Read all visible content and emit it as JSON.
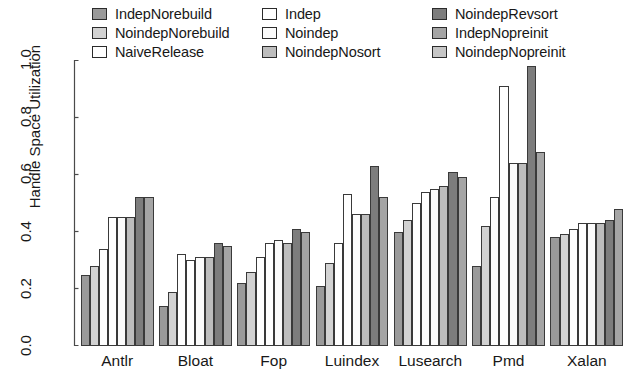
{
  "legend": {
    "entries": [
      {
        "label": "IndepNorebuild",
        "color": "#9a9a9a",
        "column": 0
      },
      {
        "label": "NoindepNorebuild",
        "color": "#d2d2d2",
        "column": 0
      },
      {
        "label": "NaiveRelease",
        "color": "#ffffff",
        "column": 0
      },
      {
        "label": "Indep",
        "color": "#ffffff",
        "column": 1
      },
      {
        "label": "Noindep",
        "color": "#fbfbfb",
        "column": 1
      },
      {
        "label": "NoindepNosort",
        "color": "#bdbdbd",
        "column": 1
      },
      {
        "label": "NoindepRevsort",
        "color": "#7d7d7d",
        "column": 2
      },
      {
        "label": "IndepNopreinit",
        "color": "#a5a5a5",
        "column": 2
      },
      {
        "label": "NoindepNopreinit",
        "color": "#c6c6c6",
        "column": 2
      }
    ]
  },
  "axes": {
    "ylabel": "Handle Space Utilization",
    "yticks": [
      "0.0",
      "0.2",
      "0.4",
      "0.6",
      "0.8",
      "1.0"
    ],
    "ytick_values": [
      0.0,
      0.2,
      0.4,
      0.6,
      0.8,
      1.0
    ],
    "ylim": [
      0.0,
      1.0
    ]
  },
  "chart_data": {
    "type": "bar",
    "title": "",
    "xlabel": "",
    "ylabel": "Handle Space Utilization",
    "ylim": [
      0.0,
      1.0
    ],
    "grid": false,
    "legend_position": "top",
    "categories": [
      "Antlr",
      "Bloat",
      "Fop",
      "Luindex",
      "Lusearch",
      "Pmd",
      "Xalan"
    ],
    "series": [
      {
        "name": "IndepNorebuild",
        "color": "#9a9a9a",
        "values": [
          0.25,
          0.14,
          0.22,
          0.21,
          0.4,
          0.28,
          0.38
        ]
      },
      {
        "name": "NoindepNorebuild",
        "color": "#d2d2d2",
        "values": [
          0.28,
          0.19,
          0.26,
          0.29,
          0.44,
          0.42,
          0.39
        ]
      },
      {
        "name": "NaiveRelease",
        "color": "#ffffff",
        "values": [
          0.34,
          0.32,
          0.31,
          0.36,
          0.5,
          0.52,
          0.41
        ]
      },
      {
        "name": "Indep",
        "color": "#ffffff",
        "values": [
          0.45,
          0.3,
          0.36,
          0.53,
          0.54,
          0.91,
          0.43
        ]
      },
      {
        "name": "Noindep",
        "color": "#fbfbfb",
        "values": [
          0.45,
          0.31,
          0.37,
          0.46,
          0.55,
          0.64,
          0.43
        ]
      },
      {
        "name": "NoindepNosort",
        "color": "#bdbdbd",
        "values": [
          0.45,
          0.31,
          0.36,
          0.46,
          0.56,
          0.64,
          0.43
        ]
      },
      {
        "name": "NoindepRevsort",
        "color": "#7d7d7d",
        "values": [
          0.52,
          0.36,
          0.41,
          0.63,
          0.61,
          0.98,
          0.44
        ]
      },
      {
        "name": "IndepNopreinit",
        "color": "#a5a5a5",
        "values": [
          0.52,
          0.35,
          0.4,
          0.52,
          0.59,
          0.68,
          0.48
        ]
      }
    ]
  }
}
